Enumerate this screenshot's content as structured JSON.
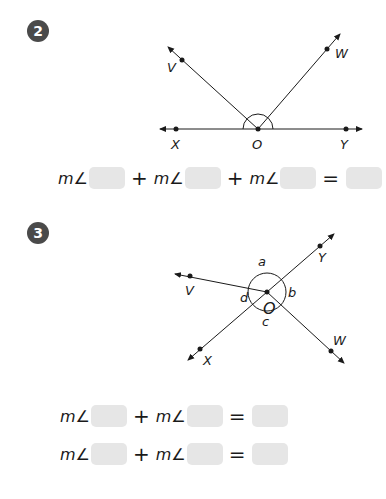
{
  "problems": [
    {
      "number": "2",
      "points": {
        "V": "V",
        "W": "W",
        "X": "X",
        "O": "O",
        "Y": "Y"
      },
      "equation": {
        "terms": [
          "m∠",
          "m∠",
          "m∠"
        ],
        "plus": "+",
        "equals": "="
      }
    },
    {
      "number": "3",
      "points": {
        "V": "V",
        "Y": "Y",
        "X": "X",
        "W": "W",
        "O": "O"
      },
      "angle_labels": {
        "a": "a",
        "b": "b",
        "c": "c",
        "d": "d"
      },
      "equations": [
        {
          "terms": [
            "m∠",
            "m∠"
          ],
          "plus": "+",
          "equals": "="
        },
        {
          "terms": [
            "m∠",
            "m∠"
          ],
          "plus": "+",
          "equals": "="
        }
      ]
    }
  ],
  "colors": {
    "badge": "#4a4a4a",
    "answer_box": "#e6e6e6",
    "line": "#1a1a1a"
  }
}
